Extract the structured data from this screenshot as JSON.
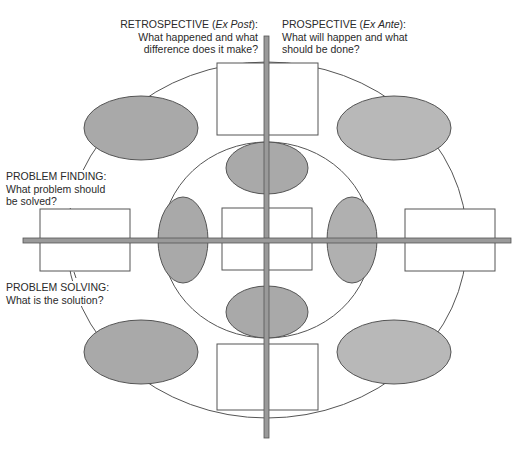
{
  "labels": {
    "retrospective": {
      "title_prefix": "RETROSPECTIVE (",
      "title_italic": "Ex Post",
      "title_suffix": "):",
      "line1": "What happened and what",
      "line2": "difference does it make?"
    },
    "prospective": {
      "title_prefix": "PROSPECTIVE (",
      "title_italic": "Ex Ante",
      "title_suffix": "):",
      "line1": "What will happen and what",
      "line2": "should be done?"
    },
    "problem_finding": {
      "title": "PROBLEM FINDING:",
      "line1": "What problem should",
      "line2": "be solved?"
    },
    "problem_solving": {
      "title": "PROBLEM SOLVING:",
      "line1": "What is the solution?"
    }
  },
  "colors": {
    "ellipse_fill": "#a9a9a9",
    "ellipse_fill_light": "#b8b8b8",
    "axis_fill": "#9a9a9a",
    "stroke": "#555555"
  }
}
